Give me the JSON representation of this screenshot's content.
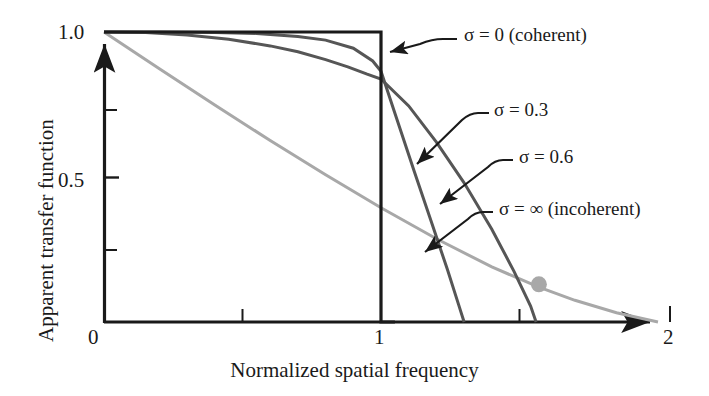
{
  "figure": {
    "axes": {
      "ylabel": "Apparent transfer function",
      "xlabel": "Normalized spatial frequency",
      "y_ticks": [
        "1.0",
        "0.5"
      ],
      "x_ticks": [
        "0",
        "1",
        "2"
      ]
    },
    "annotations": [
      {
        "id": "sigma-0",
        "label": "σ = 0 (coherent)"
      },
      {
        "id": "sigma-03",
        "label": "σ = 0.3"
      },
      {
        "id": "sigma-06",
        "label": "σ = 0.6"
      },
      {
        "id": "sigma-infinity",
        "label": "σ = ∞ (incoherent)"
      }
    ]
  },
  "chart_data": {
    "type": "line",
    "title": "",
    "xlabel": "Normalized spatial frequency",
    "ylabel": "Apparent transfer function",
    "xlim": [
      0,
      2
    ],
    "ylim": [
      0,
      1.05
    ],
    "xticks": [
      0,
      1,
      2
    ],
    "xticklabels": [
      "0",
      "1",
      "2"
    ],
    "xminorticks": [
      0.5,
      1.5
    ],
    "yticks": [
      0,
      0.5,
      1.0
    ],
    "yticklabels": [
      "0",
      "0.5",
      "1.0"
    ],
    "yminorticks": [
      0.25,
      0.75
    ],
    "grid": false,
    "legend": "annotated-inline",
    "colors": {
      "coherent": "#1a1a1a",
      "partial": "#565656",
      "incoherent": "#a8a8a8",
      "marker": "#a8a8a8"
    },
    "series": [
      {
        "name": "σ = 0 (coherent)",
        "color": "#1a1a1a",
        "x": [
          0.0,
          0.2,
          0.4,
          0.6,
          0.8,
          0.95,
          1.0,
          1.0,
          1.05
        ],
        "y": [
          1.0,
          1.0,
          1.0,
          1.0,
          1.0,
          1.0,
          1.0,
          0.0,
          0.0
        ]
      },
      {
        "name": "σ = 0.3",
        "color": "#565656",
        "x": [
          0.0,
          0.2,
          0.4,
          0.55,
          0.7,
          0.8,
          0.9,
          0.97,
          1.0,
          1.05,
          1.12,
          1.18,
          1.24,
          1.28,
          1.3
        ],
        "y": [
          1.0,
          1.0,
          0.998,
          0.995,
          0.985,
          0.972,
          0.944,
          0.9,
          0.865,
          0.72,
          0.52,
          0.35,
          0.18,
          0.06,
          0.0
        ]
      },
      {
        "name": "σ = 0.6",
        "color": "#565656",
        "x": [
          0.0,
          0.15,
          0.3,
          0.45,
          0.6,
          0.7,
          0.8,
          0.88,
          0.95,
          1.0,
          1.1,
          1.2,
          1.3,
          1.4,
          1.48,
          1.54,
          1.56
        ],
        "y": [
          1.0,
          0.998,
          0.99,
          0.975,
          0.952,
          0.932,
          0.905,
          0.88,
          0.855,
          0.838,
          0.745,
          0.62,
          0.48,
          0.32,
          0.175,
          0.055,
          0.0
        ]
      },
      {
        "name": "σ = ∞ (incoherent)",
        "color": "#a8a8a8",
        "x": [
          0.0,
          0.2,
          0.4,
          0.6,
          0.8,
          1.0,
          1.2,
          1.4,
          1.57,
          1.7,
          1.85,
          2.0
        ],
        "y": [
          1.0,
          0.873,
          0.748,
          0.626,
          0.508,
          0.394,
          0.287,
          0.19,
          0.12,
          0.075,
          0.032,
          0.0
        ]
      }
    ],
    "markers": [
      {
        "series": "σ = ∞ (incoherent)",
        "x": 1.57,
        "y": 0.13,
        "color": "#a8a8a8",
        "shape": "circle"
      }
    ]
  }
}
